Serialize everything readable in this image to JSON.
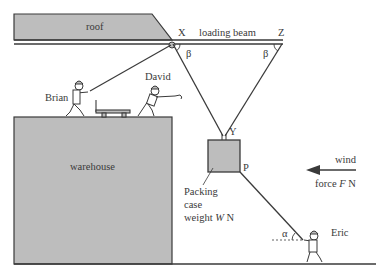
{
  "labels": {
    "roof": "roof",
    "loading_beam": "loading beam",
    "point_x": "X",
    "point_z": "Z",
    "point_y": "Y",
    "point_p": "P",
    "angle_beta_left": "β",
    "angle_beta_right": "β",
    "angle_alpha": "α",
    "brian": "Brian",
    "david": "David",
    "eric": "Eric",
    "warehouse": "warehouse",
    "packing_case_line1": "Packing",
    "packing_case_line2": "case",
    "packing_case_line3_prefix": "weight ",
    "packing_case_var": "W",
    "packing_case_unit": " N",
    "wind_line1": "wind",
    "wind_line2_prefix": "force ",
    "wind_var": "F",
    "wind_unit": " N"
  },
  "colors": {
    "fill_gray": "#bdbdbd",
    "stroke": "#3a3a3a",
    "background": "#ffffff"
  }
}
